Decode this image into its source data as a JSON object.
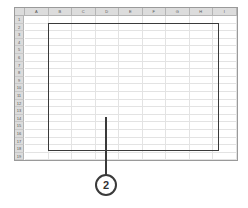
{
  "spreadsheet": {
    "columns": [
      "A",
      "B",
      "C",
      "D",
      "E",
      "F",
      "G",
      "H",
      "I"
    ],
    "rows": [
      "1",
      "2",
      "3",
      "4",
      "5",
      "6",
      "7",
      "8",
      "9",
      "10",
      "11",
      "12",
      "13",
      "14",
      "15",
      "16",
      "17",
      "18",
      "19"
    ]
  },
  "selection": {
    "range_start": "B2",
    "range_end": "H18"
  },
  "callout": {
    "label": "2"
  },
  "colors": {
    "header_bg": "#dcdcdc",
    "gridline": "#e3e3e3",
    "selection_border": "#3a3a3a"
  }
}
